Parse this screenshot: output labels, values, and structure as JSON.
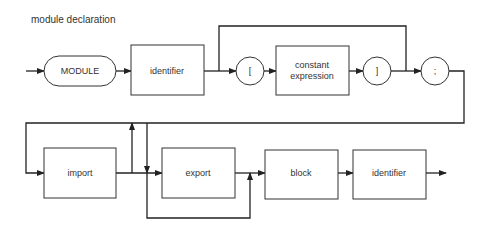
{
  "title": "module declaration",
  "nodes": {
    "module_kw": "MODULE",
    "identifier1": "identifier",
    "lbracket": "[",
    "const_expr_line1": "constant",
    "const_expr_line2": "expression",
    "rbracket": "]",
    "semicolon": ";",
    "import": "import",
    "export": "export",
    "block": "block",
    "identifier2": "identifier"
  },
  "colors": {
    "stroke": "#222222",
    "text": "#333333",
    "background": "#ffffff"
  }
}
